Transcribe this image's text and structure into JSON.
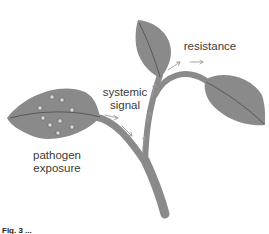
{
  "figure": {
    "labels": {
      "pathogen_line1": "pathogen",
      "pathogen_line2": "exposure",
      "systemic_line1": "systemic",
      "systemic_line2": "signal",
      "resistance": "resistance"
    },
    "caption": "Fig. 3 ...",
    "colors": {
      "leaf": "#8a8a8a",
      "stem": "#8a8a8a",
      "vein": "#4a4a4a",
      "arrow": "#9a9a9a",
      "text": "#3a3a3a",
      "pathogen_dot": "#d8d8d8"
    }
  }
}
